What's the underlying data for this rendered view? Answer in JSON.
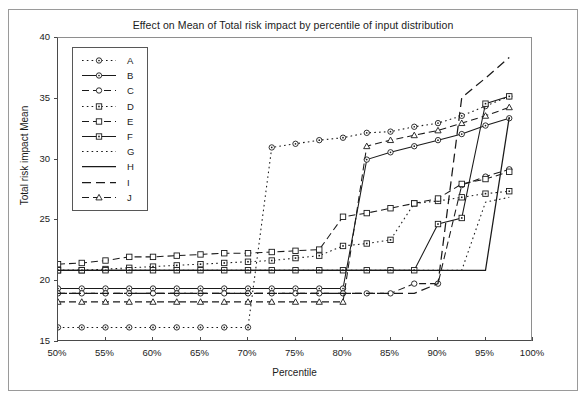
{
  "chart_data": {
    "type": "line",
    "title": "Effect on Mean of Total risk impact by percentile of input distribution",
    "xlabel": "Percentile",
    "ylabel": "Total risk impact Mean",
    "xlim": [
      50,
      100
    ],
    "ylim": [
      15,
      40
    ],
    "xticks": [
      "50%",
      "55%",
      "60%",
      "65%",
      "70%",
      "75%",
      "80%",
      "85%",
      "90%",
      "95%",
      "100%"
    ],
    "xtick_values": [
      50,
      55,
      60,
      65,
      70,
      75,
      80,
      85,
      90,
      95,
      100
    ],
    "yticks": [
      "15",
      "20",
      "25",
      "30",
      "35",
      "40"
    ],
    "ytick_values": [
      15,
      20,
      25,
      30,
      35,
      40
    ],
    "grid": false,
    "legend_position": "upper-left-inside",
    "x": [
      50,
      52.5,
      55,
      57.5,
      60,
      62.5,
      65,
      67.5,
      70,
      72.5,
      75,
      77.5,
      80,
      82.5,
      85,
      87.5,
      90,
      92.5,
      95,
      97.5
    ],
    "series": [
      {
        "name": "A",
        "style": "dotted",
        "marker": "circle",
        "values": [
          16.2,
          16.2,
          16.2,
          16.2,
          16.2,
          16.2,
          16.2,
          16.2,
          16.2,
          31.0,
          31.3,
          31.6,
          31.8,
          32.2,
          32.3,
          32.7,
          33.0,
          33.6,
          34.4,
          35.2
        ]
      },
      {
        "name": "B",
        "style": "solid-marker",
        "marker": "circle",
        "values": [
          19.4,
          19.4,
          19.4,
          19.4,
          19.4,
          19.4,
          19.4,
          19.4,
          19.4,
          19.4,
          19.4,
          19.4,
          19.4,
          30.0,
          30.6,
          31.1,
          31.6,
          32.1,
          32.8,
          33.4
        ]
      },
      {
        "name": "C",
        "style": "dashed",
        "marker": "circle-open",
        "values": [
          19.0,
          19.0,
          19.0,
          19.0,
          19.0,
          19.0,
          19.0,
          19.0,
          19.0,
          19.0,
          19.0,
          19.0,
          19.0,
          19.0,
          19.0,
          19.8,
          19.8,
          27.9,
          28.6,
          29.2
        ]
      },
      {
        "name": "D",
        "style": "dotted",
        "marker": "square-dot",
        "values": [
          20.9,
          20.9,
          21.0,
          21.1,
          21.2,
          21.3,
          21.4,
          21.5,
          21.6,
          21.7,
          21.9,
          22.1,
          22.9,
          23.1,
          23.4,
          26.4,
          26.6,
          26.9,
          27.2,
          27.4
        ]
      },
      {
        "name": "E",
        "style": "dashed",
        "marker": "square-open",
        "values": [
          21.4,
          21.5,
          21.7,
          22.0,
          22.0,
          22.1,
          22.2,
          22.3,
          22.3,
          22.4,
          22.5,
          22.6,
          25.3,
          25.6,
          26.0,
          26.4,
          26.8,
          28.0,
          28.4,
          29.0
        ]
      },
      {
        "name": "F",
        "style": "solid-marker",
        "marker": "square-dot",
        "values": [
          20.9,
          20.9,
          20.9,
          20.9,
          20.9,
          20.9,
          20.9,
          20.9,
          20.9,
          20.9,
          20.9,
          20.9,
          20.9,
          20.9,
          20.9,
          20.9,
          24.7,
          25.2,
          34.6,
          35.2
        ]
      },
      {
        "name": "G",
        "style": "dotted-plain",
        "marker": "none",
        "values": [
          20.9,
          20.9,
          20.9,
          20.9,
          20.9,
          20.9,
          20.9,
          20.9,
          20.9,
          20.9,
          20.9,
          20.9,
          20.9,
          20.9,
          20.9,
          20.9,
          20.9,
          20.9,
          26.5,
          26.9
        ]
      },
      {
        "name": "H",
        "style": "solid-plain",
        "marker": "none",
        "values": [
          20.9,
          20.9,
          20.9,
          20.9,
          20.9,
          20.9,
          20.9,
          20.9,
          20.9,
          20.9,
          20.9,
          20.9,
          20.9,
          20.9,
          20.9,
          20.9,
          20.9,
          20.9,
          20.9,
          33.5
        ]
      },
      {
        "name": "I",
        "style": "dashed-plain",
        "marker": "none",
        "values": [
          19.0,
          19.0,
          19.0,
          19.0,
          19.0,
          19.0,
          19.0,
          19.0,
          19.0,
          19.0,
          19.0,
          19.0,
          19.0,
          19.0,
          19.0,
          19.0,
          19.8,
          35.1,
          36.7,
          38.4
        ]
      },
      {
        "name": "J",
        "style": "dashed",
        "marker": "triangle",
        "values": [
          18.3,
          18.3,
          18.3,
          18.3,
          18.3,
          18.3,
          18.3,
          18.3,
          18.3,
          18.3,
          18.3,
          18.3,
          18.3,
          31.1,
          31.6,
          32.0,
          32.4,
          33.0,
          33.6,
          34.3
        ]
      }
    ],
    "legend_entries": [
      {
        "label": "A",
        "style": "dotted",
        "marker": "circle"
      },
      {
        "label": "B",
        "style": "solid-marker",
        "marker": "circle"
      },
      {
        "label": "C",
        "style": "dashed",
        "marker": "circle-open"
      },
      {
        "label": "D",
        "style": "dotted",
        "marker": "square-dot"
      },
      {
        "label": "E",
        "style": "dashed",
        "marker": "square-open"
      },
      {
        "label": "F",
        "style": "solid-marker",
        "marker": "square-dot"
      },
      {
        "label": "G",
        "style": "dotted-plain",
        "marker": "none"
      },
      {
        "label": "H",
        "style": "solid-plain",
        "marker": "none"
      },
      {
        "label": "I",
        "style": "dashed-plain",
        "marker": "none"
      },
      {
        "label": "J",
        "style": "dashed",
        "marker": "triangle"
      }
    ],
    "line_color": "#1a1a1a"
  }
}
